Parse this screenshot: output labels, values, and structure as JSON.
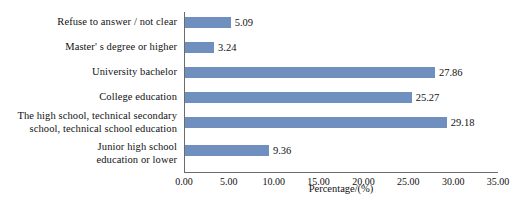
{
  "chart_data": {
    "type": "bar",
    "orientation": "horizontal",
    "title": "",
    "xlabel": "Percentage/(%)",
    "ylabel": "",
    "xlim": [
      0,
      35
    ],
    "xticks": [
      "0.00",
      "5.00",
      "10.00",
      "15.00",
      "20.00",
      "25.00",
      "30.00",
      "35.00"
    ],
    "xtick_values": [
      0,
      5,
      10,
      15,
      20,
      25,
      30,
      35
    ],
    "grid": false,
    "legend": false,
    "bar_color": "#6f8fbe",
    "axis_color": "#6b6b6b",
    "categories": [
      "Refuse to answer / not clear",
      "Master' s degree or higher",
      "University bachelor",
      "College education",
      "The high school, technical secondary\nschool, technical school education",
      "Junior high school\neducation or lower"
    ],
    "values": [
      5.09,
      3.24,
      27.86,
      25.27,
      29.18,
      9.36
    ],
    "value_labels": [
      "5.09",
      "3.24",
      "27.86",
      "25.27",
      "29.18",
      "9.36"
    ]
  }
}
